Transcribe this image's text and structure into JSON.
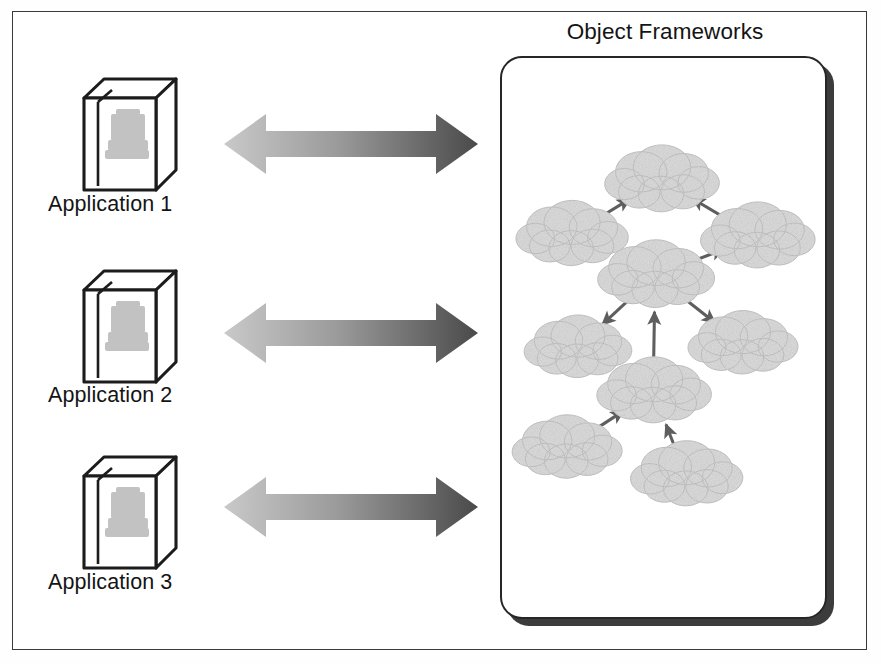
{
  "figure": {
    "kind": "architecture-diagram",
    "frame_border_color": "#3a3a3a",
    "background_color": "#ffffff"
  },
  "applications": [
    {
      "label": "Application 1",
      "icon": "software-box-icon"
    },
    {
      "label": "Application 2",
      "icon": "software-box-icon"
    },
    {
      "label": "Application 3",
      "icon": "software-box-icon"
    }
  ],
  "connectors": [
    {
      "icon": "double-headed-arrow-icon",
      "direction": "bidirectional",
      "from": "Application 1",
      "to": "Object Frameworks"
    },
    {
      "icon": "double-headed-arrow-icon",
      "direction": "bidirectional",
      "from": "Application 2",
      "to": "Object Frameworks"
    },
    {
      "icon": "double-headed-arrow-icon",
      "direction": "bidirectional",
      "from": "Application 3",
      "to": "Object Frameworks"
    }
  ],
  "panel": {
    "title": "Object Frameworks",
    "border_color": "#262626",
    "shadow_color": "#2b2b2b",
    "shape": "rounded-rectangle"
  },
  "colors": {
    "arrow_gradient_start": "#c9c9c9",
    "arrow_gradient_end": "#4a4a4a",
    "cloud_fill": "#dcdcdc",
    "cloud_stroke": "#c4c4c4",
    "graph_arrow": "#5e5e5e",
    "text": "#141414"
  },
  "framework_graph": {
    "node_icon": "cloud-icon",
    "node_count": 9,
    "edge_icon": "arrow-icon",
    "edge_count": 8,
    "nodes": [
      {
        "id": "n1",
        "x": 161,
        "y": 123,
        "rx": 50,
        "ry": 28
      },
      {
        "id": "n2",
        "x": 70,
        "y": 178,
        "rx": 49,
        "ry": 27
      },
      {
        "id": "n3",
        "x": 258,
        "y": 180,
        "rx": 50,
        "ry": 27
      },
      {
        "id": "n4",
        "x": 155,
        "y": 219,
        "rx": 51,
        "ry": 28
      },
      {
        "id": "n5",
        "x": 76,
        "y": 292,
        "rx": 47,
        "ry": 26
      },
      {
        "id": "n6",
        "x": 243,
        "y": 288,
        "rx": 48,
        "ry": 26
      },
      {
        "id": "n7",
        "x": 153,
        "y": 336,
        "rx": 50,
        "ry": 27
      },
      {
        "id": "n8",
        "x": 65,
        "y": 393,
        "rx": 48,
        "ry": 26
      },
      {
        "id": "n9",
        "x": 186,
        "y": 420,
        "rx": 49,
        "ry": 27
      }
    ],
    "edges": [
      {
        "from": "n2",
        "to": "n1",
        "arrowhead": "end"
      },
      {
        "from": "n3",
        "to": "n1",
        "arrowhead": "end"
      },
      {
        "from": "n4",
        "to": "n3",
        "arrowhead": "end"
      },
      {
        "from": "n4",
        "to": "n5",
        "arrowhead": "end"
      },
      {
        "from": "n4",
        "to": "n6",
        "arrowhead": "end"
      },
      {
        "from": "n7",
        "to": "n4",
        "arrowhead": "end"
      },
      {
        "from": "n8",
        "to": "n7",
        "arrowhead": "end"
      },
      {
        "from": "n9",
        "to": "n7",
        "arrowhead": "end"
      }
    ]
  },
  "layout": {
    "rows": [
      {
        "icon_top": 74,
        "label_top": 192,
        "arrow_top": 105
      },
      {
        "icon_top": 266,
        "label_top": 383,
        "arrow_top": 294
      },
      {
        "icon_top": 452,
        "label_top": 570,
        "arrow_top": 468
      }
    ]
  }
}
